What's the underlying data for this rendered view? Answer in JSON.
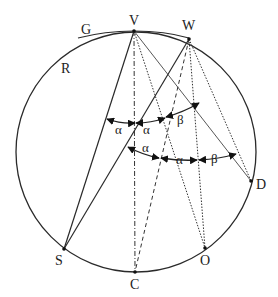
{
  "diagram": {
    "circle_label": "R",
    "tangent_label": "G",
    "points": {
      "V": "V",
      "W": "W",
      "D": "D",
      "O": "O",
      "C": "C",
      "S": "S"
    },
    "upper_arc": {
      "labels": [
        "α",
        "α",
        "β"
      ]
    },
    "lower_arc": {
      "labels": [
        "α",
        "α",
        "β"
      ]
    }
  }
}
